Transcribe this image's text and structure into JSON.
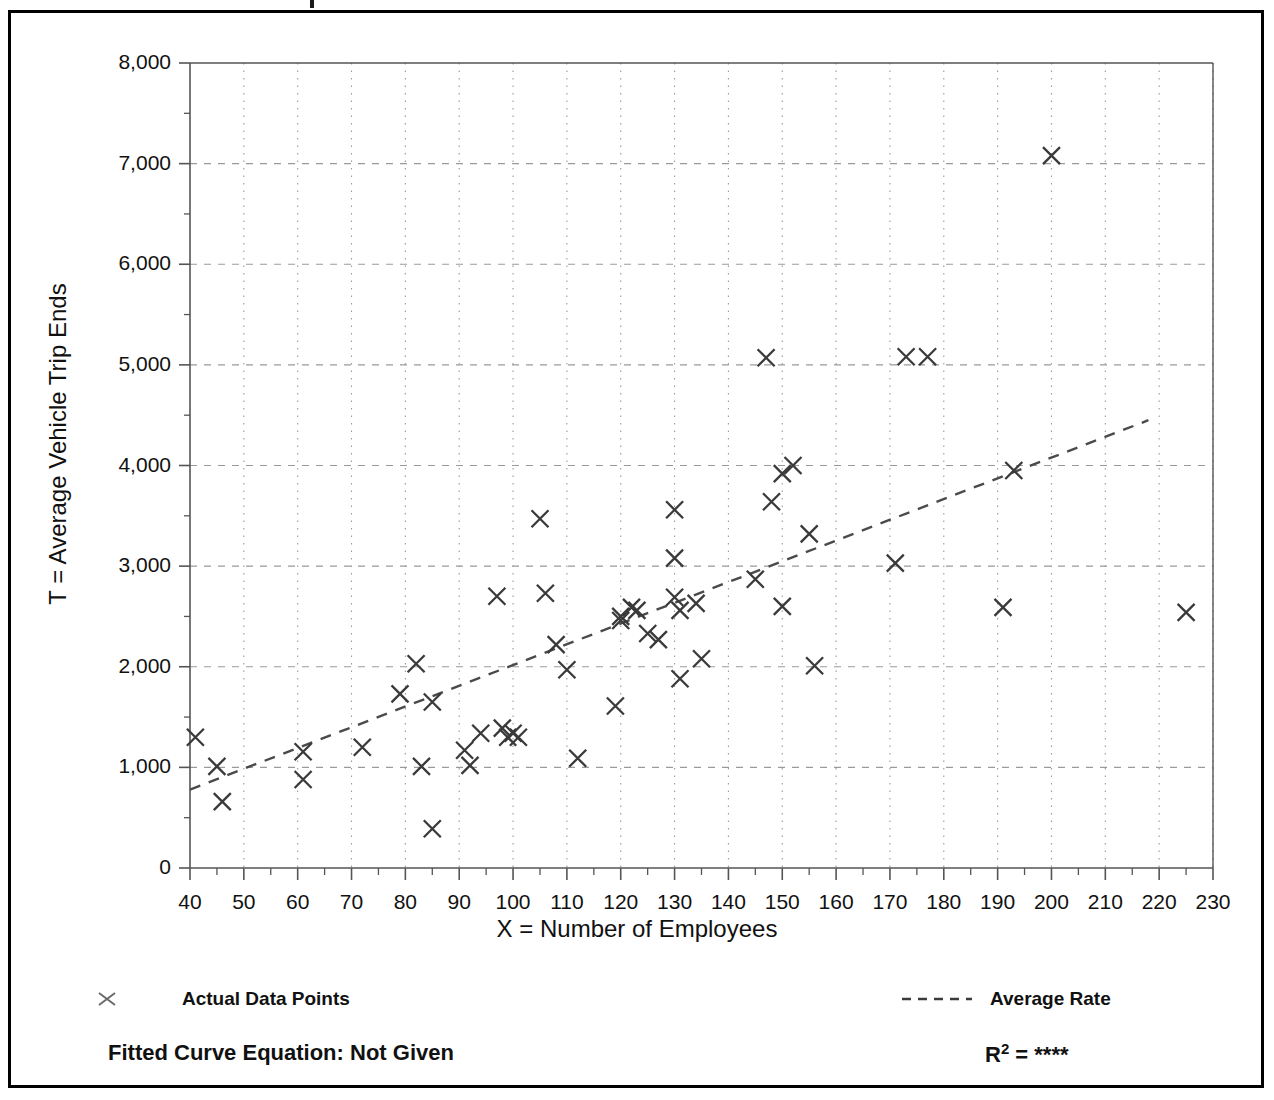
{
  "chart_data": {
    "type": "scatter",
    "title": "",
    "xlabel": "X = Number of Employees",
    "ylabel": "T = Average Vehicle Trip Ends",
    "xlim": [
      40,
      230
    ],
    "ylim": [
      0,
      8000
    ],
    "xticks": [
      40,
      50,
      60,
      70,
      80,
      90,
      100,
      110,
      120,
      130,
      140,
      150,
      160,
      170,
      180,
      190,
      200,
      210,
      220,
      230
    ],
    "xtick_labels": [
      "40",
      "50",
      "60",
      "70",
      "80",
      "90",
      "100",
      "110",
      "120",
      "130",
      "140",
      "150",
      "160",
      "170",
      "180",
      "190",
      "200",
      "210",
      "220",
      "230"
    ],
    "yticks": [
      0,
      1000,
      2000,
      3000,
      4000,
      5000,
      6000,
      7000,
      8000
    ],
    "ytick_labels": [
      "0",
      "1,000",
      "2,000",
      "3,000",
      "4,000",
      "5,000",
      "6,000",
      "7,000",
      "8,000"
    ],
    "grid": true,
    "grid_style": "dotted",
    "legend_position": "below-axes",
    "series": [
      {
        "name": "Actual Data Points",
        "marker": "x",
        "color": "#3a3a3a",
        "points": [
          [
            41,
            1300
          ],
          [
            45,
            1010
          ],
          [
            46,
            660
          ],
          [
            61,
            1155
          ],
          [
            61,
            880
          ],
          [
            72,
            1200
          ],
          [
            79,
            1730
          ],
          [
            82,
            2030
          ],
          [
            83,
            1010
          ],
          [
            85,
            1650
          ],
          [
            85,
            390
          ],
          [
            91,
            1170
          ],
          [
            92,
            1020
          ],
          [
            94,
            1340
          ],
          [
            97,
            2700
          ],
          [
            98,
            1390
          ],
          [
            99,
            1300
          ],
          [
            100,
            1340
          ],
          [
            101,
            1300
          ],
          [
            105,
            3470
          ],
          [
            106,
            2730
          ],
          [
            108,
            2220
          ],
          [
            110,
            1970
          ],
          [
            112,
            1090
          ],
          [
            119,
            1610
          ],
          [
            120,
            2500
          ],
          [
            120,
            2460
          ],
          [
            122,
            2590
          ],
          [
            123,
            2560
          ],
          [
            125,
            2330
          ],
          [
            127,
            2270
          ],
          [
            130,
            3560
          ],
          [
            130,
            3080
          ],
          [
            130,
            2690
          ],
          [
            131,
            2560
          ],
          [
            131,
            1880
          ],
          [
            134,
            2630
          ],
          [
            135,
            2080
          ],
          [
            145,
            2870
          ],
          [
            147,
            5070
          ],
          [
            148,
            3640
          ],
          [
            150,
            3920
          ],
          [
            150,
            2600
          ],
          [
            152,
            4000
          ],
          [
            155,
            3320
          ],
          [
            156,
            2010
          ],
          [
            171,
            3030
          ],
          [
            173,
            5080
          ],
          [
            177,
            5080
          ],
          [
            191,
            2590
          ],
          [
            193,
            3950
          ],
          [
            200,
            7080
          ],
          [
            225,
            2540
          ]
        ]
      }
    ],
    "trendline": {
      "name": "Average Rate",
      "style": "dashed",
      "color": "#4a4a4a",
      "x_start": 40,
      "y_start": 780,
      "x_end": 218,
      "y_end": 4450
    }
  },
  "legend": {
    "points_label": "Actual Data Points",
    "line_label": "Average Rate",
    "point_marker_icon": "x-marker-icon",
    "line_marker_icon": "dashed-line-icon"
  },
  "footer": {
    "fitted_equation_label": "Fitted Curve Equation:  Not Given",
    "r_squared_prefix": "R",
    "r_squared_exponent": "2",
    "r_squared_equals": " = ",
    "r_squared_value": "****"
  },
  "colors": {
    "frame": "#000000",
    "axis": "#555555",
    "grid": "#9a9a9a",
    "marker": "#3a3a3a",
    "trend": "#4a4a4a",
    "text": "#111111"
  }
}
